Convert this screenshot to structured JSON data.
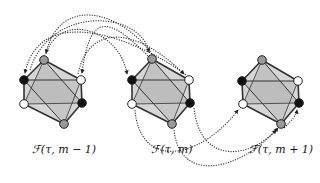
{
  "diagram": {
    "title": "",
    "colors": {
      "face_dark": "#b9b9b9",
      "face_light": "#d6d6d6",
      "edge": "#333333",
      "node_gray": "#9a9a9a",
      "node_black": "#111111",
      "node_white": "#ffffff",
      "arrow": "#333333"
    },
    "octahedra": [
      {
        "id": "oct-m-minus-1",
        "label": "ℱ(τ, m − 1)",
        "label_pos": [
          64,
          150
        ],
        "nodes": {
          "top": {
            "x": 44,
            "y": 60,
            "color": "gray"
          },
          "left_upper": {
            "x": 24,
            "y": 80,
            "color": "black"
          },
          "right_upper": {
            "x": 81,
            "y": 80,
            "color": "white"
          },
          "left_lower": {
            "x": 24,
            "y": 104,
            "color": "white"
          },
          "right_lower": {
            "x": 82,
            "y": 103,
            "color": "black"
          },
          "bottom": {
            "x": 64,
            "y": 124,
            "color": "gray"
          }
        }
      },
      {
        "id": "oct-m",
        "label": "ℱ(τ, m)",
        "label_pos": [
          172,
          150
        ],
        "nodes": {
          "top": {
            "x": 152,
            "y": 59,
            "color": "gray"
          },
          "left_upper": {
            "x": 132,
            "y": 80,
            "color": "black"
          },
          "right_upper": {
            "x": 189,
            "y": 80,
            "color": "white"
          },
          "left_lower": {
            "x": 132,
            "y": 104,
            "color": "white"
          },
          "right_lower": {
            "x": 190,
            "y": 103,
            "color": "black"
          },
          "bottom": {
            "x": 172,
            "y": 124,
            "color": "gray"
          }
        }
      },
      {
        "id": "oct-m-plus-1",
        "label": "ℱ(τ, m + 1)",
        "label_pos": [
          281,
          150
        ],
        "nodes": {
          "top": {
            "x": 262,
            "y": 60,
            "color": "gray"
          },
          "left_upper": {
            "x": 242,
            "y": 81,
            "color": "black"
          },
          "right_upper": {
            "x": 298,
            "y": 81,
            "color": "white"
          },
          "left_lower": {
            "x": 243,
            "y": 104,
            "color": "white"
          },
          "right_lower": {
            "x": 299,
            "y": 103,
            "color": "black"
          },
          "bottom": {
            "x": 281,
            "y": 124,
            "color": "gray"
          }
        }
      }
    ],
    "arrows": [
      {
        "name": "arrow-top-m-to-top-m-1",
        "path": "M 152 54 C 120 10, 60 -5, 46 53"
      },
      {
        "name": "arrow-topright-m-to-leftupper-m-1",
        "path": "M 186 75 C 140 40, 40 0, 25 73"
      },
      {
        "name": "arrow-top-m-to-rightupper-m-1",
        "path": "M 148 56 C 110 18, 90 10, 82 73"
      },
      {
        "name": "arrow-from-m-1-to-leftupper-m",
        "path": "M 46 54 C 60 10, 120 30, 127 74"
      },
      {
        "name": "arrow-leftupper-m-1-to-top-m",
        "path": "M 30 70 C 50 5, 140 10, 149 52"
      },
      {
        "name": "arrow-m-1-to-rightupper-m",
        "path": "M 78 74 C 90 20, 140 30, 184 74"
      },
      {
        "name": "arrow-leftlower-m-to-rightupper-m-1",
        "path": "M 135 110 C 140 170, 200 160, 238 110"
      },
      {
        "name": "arrow-rightlower-m-to-bottom-m-1",
        "path": "M 194 108 C 200 165, 250 160, 278 128"
      },
      {
        "name": "arrow-bottom-m-to-bottom-m-1",
        "path": "M 174 130 C 180 185, 240 170, 276 130"
      },
      {
        "name": "arrow-bottom-m-1-to-rightlower",
        "path": "M 284 128 C 292 120, 296 116, 297 110"
      }
    ]
  }
}
